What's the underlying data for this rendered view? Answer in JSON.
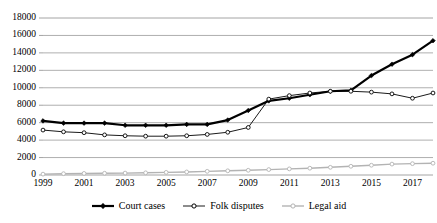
{
  "chart_data": {
    "type": "line",
    "title": "",
    "subtitle": "",
    "xlabel": "",
    "ylabel": "",
    "xlim": [
      1999,
      2018
    ],
    "ylim": [
      0,
      18000
    ],
    "ytick_step": 2000,
    "grid": "horizontal",
    "legend_position": "bottom-center",
    "x": [
      1999,
      2000,
      2001,
      2002,
      2003,
      2004,
      2005,
      2006,
      2007,
      2008,
      2009,
      2010,
      2011,
      2012,
      2013,
      2014,
      2015,
      2016,
      2017,
      2018
    ],
    "xtick_labels": [
      "1999",
      "2001",
      "2003",
      "2005",
      "2007",
      "2009",
      "2011",
      "2013",
      "2015",
      "2017"
    ],
    "xtick_values": [
      1999,
      2001,
      2003,
      2005,
      2007,
      2009,
      2011,
      2013,
      2015,
      2017
    ],
    "ytick_labels": [
      "0",
      "2000",
      "4000",
      "6000",
      "8000",
      "10000",
      "12000",
      "14000",
      "16000",
      "18000"
    ],
    "ytick_values": [
      0,
      2000,
      4000,
      6000,
      8000,
      10000,
      12000,
      14000,
      16000,
      18000
    ],
    "series": [
      {
        "name": "Court cases",
        "color": "#000000",
        "marker": "filled-diamond",
        "line_width": 2.2,
        "values": [
          6200,
          5950,
          5950,
          5950,
          5700,
          5700,
          5700,
          5800,
          5800,
          6300,
          7400,
          8500,
          8800,
          9200,
          9600,
          9700,
          11400,
          12700,
          13800,
          15400
        ]
      },
      {
        "name": "Folk disputes",
        "color": "#000000",
        "marker": "open-circle",
        "line_width": 0.9,
        "values": [
          5150,
          4950,
          4850,
          4600,
          4500,
          4450,
          4450,
          4500,
          4650,
          4900,
          5450,
          8700,
          9100,
          9400,
          9600,
          9600,
          9500,
          9300,
          8800,
          9400
        ]
      },
      {
        "name": "Legal aid",
        "color": "#b3b3b3",
        "marker": "open-circle",
        "line_width": 1.4,
        "values": [
          100,
          150,
          180,
          200,
          220,
          250,
          300,
          350,
          420,
          480,
          540,
          620,
          700,
          780,
          880,
          1000,
          1120,
          1250,
          1300,
          1350
        ]
      }
    ]
  },
  "legend": {
    "items": [
      {
        "label": "Court cases",
        "icon": "line-marker-filled-diamond-icon"
      },
      {
        "label": "Folk disputes",
        "icon": "line-marker-open-circle-icon"
      },
      {
        "label": "Legal aid",
        "icon": "line-marker-gray-icon"
      }
    ]
  },
  "colors": {
    "court_cases": "#000000",
    "folk_disputes": "#000000",
    "legal_aid": "#b3b3b3",
    "gridline": "#9a9a9a",
    "background": "#ffffff"
  }
}
